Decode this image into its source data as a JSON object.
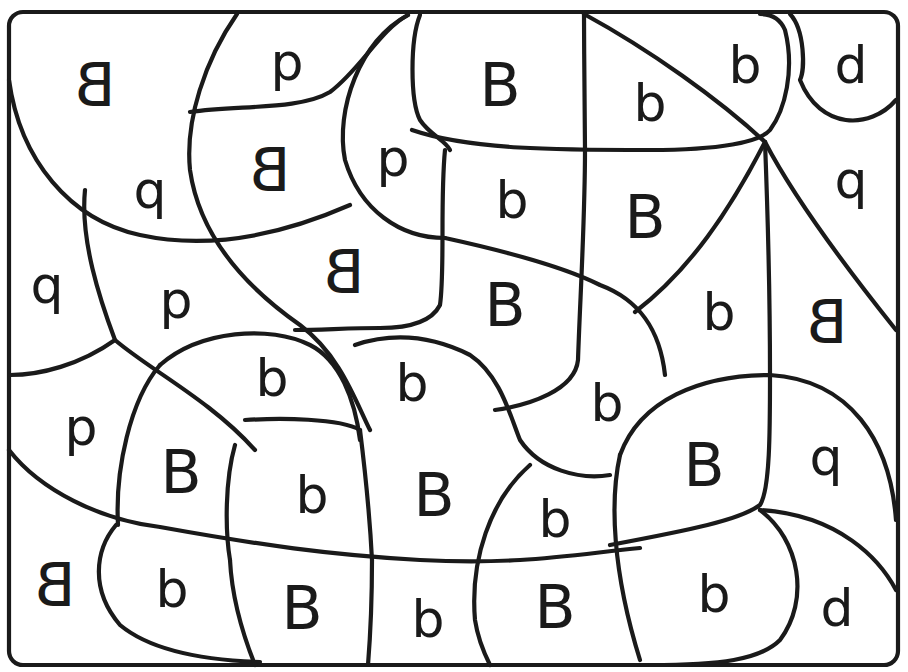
{
  "worksheet": {
    "type": "color-by-letter puzzle",
    "border_color": "#1a1a1a",
    "background": "#ffffff",
    "regions": [
      {
        "id": "r1",
        "letter": "B",
        "mirrored": true,
        "x": 95,
        "y": 85
      },
      {
        "id": "r2",
        "letter": "p",
        "mirrored": false,
        "x": 287,
        "y": 62
      },
      {
        "id": "r3",
        "letter": "B",
        "mirrored": false,
        "x": 500,
        "y": 85
      },
      {
        "id": "r4",
        "letter": "b",
        "mirrored": false,
        "x": 650,
        "y": 103
      },
      {
        "id": "r5",
        "letter": "b",
        "mirrored": false,
        "x": 745,
        "y": 65
      },
      {
        "id": "r6",
        "letter": "d",
        "mirrored": false,
        "x": 851,
        "y": 65
      },
      {
        "id": "r7",
        "letter": "q",
        "mirrored": false,
        "x": 150,
        "y": 190
      },
      {
        "id": "r8",
        "letter": "B",
        "mirrored": true,
        "x": 270,
        "y": 170
      },
      {
        "id": "r9",
        "letter": "p",
        "mirrored": false,
        "x": 393,
        "y": 158
      },
      {
        "id": "r10",
        "letter": "b",
        "mirrored": false,
        "x": 512,
        "y": 200
      },
      {
        "id": "r11",
        "letter": "B",
        "mirrored": false,
        "x": 645,
        "y": 217
      },
      {
        "id": "r12",
        "letter": "q",
        "mirrored": false,
        "x": 851,
        "y": 180
      },
      {
        "id": "r13",
        "letter": "q",
        "mirrored": false,
        "x": 47,
        "y": 285
      },
      {
        "id": "r14",
        "letter": "p",
        "mirrored": false,
        "x": 176,
        "y": 300
      },
      {
        "id": "r15",
        "letter": "B",
        "mirrored": true,
        "x": 344,
        "y": 272
      },
      {
        "id": "r16",
        "letter": "B",
        "mirrored": false,
        "x": 505,
        "y": 305
      },
      {
        "id": "r17",
        "letter": "b",
        "mirrored": false,
        "x": 719,
        "y": 312
      },
      {
        "id": "r18",
        "letter": "B",
        "mirrored": true,
        "x": 827,
        "y": 322
      },
      {
        "id": "r19",
        "letter": "p",
        "mirrored": false,
        "x": 81,
        "y": 427
      },
      {
        "id": "r20",
        "letter": "b",
        "mirrored": false,
        "x": 272,
        "y": 378
      },
      {
        "id": "r21",
        "letter": "b",
        "mirrored": false,
        "x": 412,
        "y": 383
      },
      {
        "id": "r22",
        "letter": "b",
        "mirrored": false,
        "x": 607,
        "y": 403
      },
      {
        "id": "r23",
        "letter": "B",
        "mirrored": false,
        "x": 181,
        "y": 472
      },
      {
        "id": "r24",
        "letter": "b",
        "mirrored": false,
        "x": 312,
        "y": 495
      },
      {
        "id": "r25",
        "letter": "B",
        "mirrored": false,
        "x": 434,
        "y": 495
      },
      {
        "id": "r26",
        "letter": "B",
        "mirrored": false,
        "x": 704,
        "y": 465
      },
      {
        "id": "r27",
        "letter": "q",
        "mirrored": false,
        "x": 826,
        "y": 457
      },
      {
        "id": "r28",
        "letter": "b",
        "mirrored": false,
        "x": 555,
        "y": 519
      },
      {
        "id": "r29",
        "letter": "B",
        "mirrored": true,
        "x": 55,
        "y": 585
      },
      {
        "id": "r30",
        "letter": "b",
        "mirrored": false,
        "x": 172,
        "y": 589
      },
      {
        "id": "r31",
        "letter": "B",
        "mirrored": false,
        "x": 302,
        "y": 608
      },
      {
        "id": "r32",
        "letter": "b",
        "mirrored": false,
        "x": 428,
        "y": 619
      },
      {
        "id": "r33",
        "letter": "B",
        "mirrored": false,
        "x": 555,
        "y": 607
      },
      {
        "id": "r34",
        "letter": "b",
        "mirrored": false,
        "x": 714,
        "y": 594
      },
      {
        "id": "r35",
        "letter": "d",
        "mirrored": false,
        "x": 837,
        "y": 608
      }
    ]
  }
}
